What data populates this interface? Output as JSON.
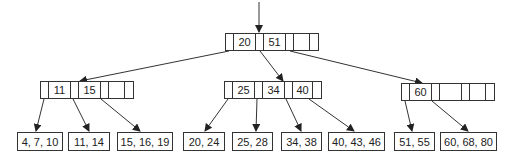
{
  "diagram": {
    "type": "B-tree",
    "root": {
      "keys": [
        "20",
        "51",
        ""
      ]
    },
    "internal": [
      {
        "keys": [
          "11",
          "15",
          ""
        ]
      },
      {
        "keys": [
          "25",
          "34",
          "40"
        ]
      },
      {
        "keys": [
          "60",
          "",
          ""
        ]
      }
    ],
    "leaves": [
      "4, 7, 10",
      "11, 14",
      "15, 16, 19",
      "20, 24",
      "25, 28",
      "34, 38",
      "40, 43, 46",
      "51, 55",
      "60, 68, 80"
    ],
    "colors": {
      "line": "#333333",
      "background": "#ffffff"
    }
  }
}
